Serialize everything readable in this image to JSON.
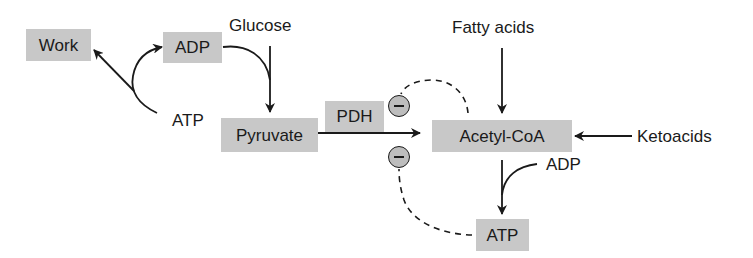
{
  "colors": {
    "box": "#c8c8c8",
    "text": "#1a1a1a",
    "inhibitor_fill": "#bdbdbd",
    "line": "#1a1a1a"
  },
  "nodes": {
    "work": "Work",
    "adp_top": "ADP",
    "pyruvate": "Pyruvate",
    "pdh": "PDH",
    "acetyl_coa": "Acetyl-CoA",
    "atp_bottom": "ATP"
  },
  "labels": {
    "glucose": "Glucose",
    "atp_left": "ATP",
    "fatty_acids": "Fatty acids",
    "ketoacids": "Ketoacids",
    "adp_right": "ADP"
  },
  "inhibitors": [
    {
      "symbol": "minus",
      "target": "PDH",
      "source": "Acetyl-CoA"
    },
    {
      "symbol": "minus",
      "target": "PDH",
      "source": "ATP"
    }
  ],
  "edges": [
    {
      "from": "ATP",
      "to": "Work",
      "style": "solid"
    },
    {
      "from": "ATP",
      "to": "ADP",
      "style": "solid"
    },
    {
      "from": "ADP",
      "to": "Pyruvate",
      "style": "solid",
      "via": "Glucose"
    },
    {
      "from": "Glucose",
      "to": "Pyruvate",
      "style": "solid"
    },
    {
      "from": "Pyruvate",
      "to": "Acetyl-CoA",
      "style": "solid",
      "enzyme": "PDH"
    },
    {
      "from": "Fatty acids",
      "to": "Acetyl-CoA",
      "style": "solid"
    },
    {
      "from": "Ketoacids",
      "to": "Acetyl-CoA",
      "style": "solid"
    },
    {
      "from": "Acetyl-CoA",
      "to": "ATP",
      "style": "solid",
      "cofactor": "ADP"
    },
    {
      "from": "Acetyl-CoA",
      "to": "PDH",
      "style": "dashed",
      "effect": "inhibition"
    },
    {
      "from": "ATP",
      "to": "PDH",
      "style": "dashed",
      "effect": "inhibition"
    }
  ]
}
